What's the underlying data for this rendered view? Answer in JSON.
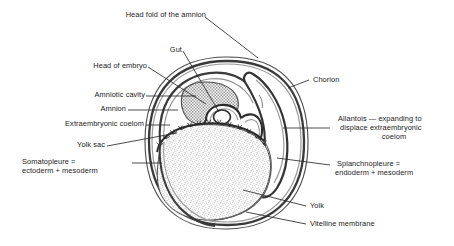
{
  "figure": {
    "background_color": "#ffffff",
    "ink_color": "#1a1a1a",
    "width": 454,
    "height": 246
  },
  "labels": {
    "head_fold": "Head fold of the amnion",
    "gut": "Gut",
    "head_of_embryo": "Head of embryo",
    "amniotic_cavity": "Amniotic cavity",
    "amnion": "Amnion",
    "extraembryonic_coelom": "Extraembryonic coelom",
    "yolk_sac": "Yolk sac",
    "somatopleure_line1": "Somatopleure =",
    "somatopleure_line2": "ectoderm + mesoderm",
    "chorion": "Chorion",
    "allantois_line1": "Allantois — expanding to",
    "allantois_line2": "displace extraembryonic",
    "allantois_line3": "coelom",
    "splanchnopleure_line1": "Splanchnopleure =",
    "splanchnopleure_line2": "endoderm + mesoderm",
    "yolk": "Yolk",
    "vitelline_membrane": "Vitelline membrane"
  },
  "structures": {
    "chorion_name": "chorion-outer-membrane",
    "vitelline_name": "vitelline-membrane-layer",
    "amniotic_cavity_name": "amniotic-cavity-region",
    "yolk_mass_name": "yolk-mass-region",
    "allantois_name": "allantois-sac",
    "embryo_name": "embryo-body",
    "gut_name": "gut-cavity",
    "yolk_sac_name": "yolk-sac-membrane"
  },
  "colors": {
    "outline": "#1a1a1a",
    "membrane_gray": "#7d7d7d",
    "amniotic_fill": "#d2d2d2",
    "yolk_fill": "#efefef",
    "leader_line": "#2a2a2a"
  }
}
